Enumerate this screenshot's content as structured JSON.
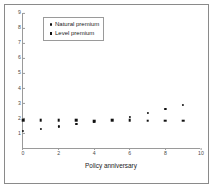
{
  "chart_data": {
    "type": "scatter",
    "title": "",
    "xlabel": "Policy anniversary",
    "ylabel": "",
    "xlim": [
      0,
      10
    ],
    "ylim": [
      0,
      9
    ],
    "xticks": [
      "0",
      "2",
      "4",
      "6",
      "8",
      "10"
    ],
    "xtick_values": [
      0,
      2,
      4,
      6,
      8,
      10
    ],
    "yticks": [
      "1",
      "2",
      "3",
      "4",
      "5",
      "6",
      "7",
      "8",
      "9"
    ],
    "ytick_values": [
      1,
      2,
      3,
      4,
      5,
      6,
      7,
      8,
      9
    ],
    "grid": false,
    "legend_position": "top-left",
    "x": [
      0,
      1,
      2,
      3,
      4,
      5,
      6,
      7,
      8,
      9
    ],
    "series": [
      {
        "name": "Natural premium",
        "marker": "circle",
        "color": "#111111",
        "values": [
          1.2,
          1.35,
          1.5,
          1.65,
          1.8,
          1.95,
          2.1,
          2.4,
          2.65,
          2.9
        ]
      },
      {
        "name": "Level premium",
        "marker": "square",
        "color": "#111111",
        "values": [
          1.92,
          1.92,
          1.9,
          1.92,
          1.85,
          1.9,
          1.9,
          1.88,
          1.88,
          1.88
        ]
      }
    ]
  },
  "colors": {
    "frame": "#8a8a8a",
    "axis": "#9a9a9a",
    "marker": "#111111",
    "background": "#ffffff",
    "tick_label": "#4a4a4a",
    "axis_label": "#1a1a1a"
  }
}
